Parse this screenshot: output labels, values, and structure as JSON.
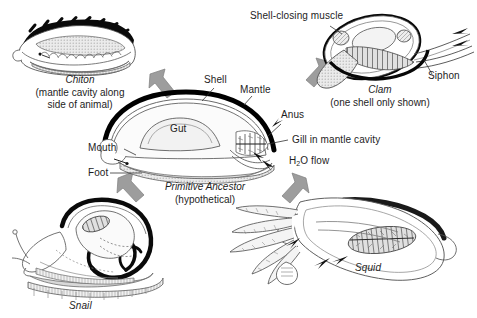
{
  "figure": {
    "background_color": "#ffffff",
    "ink_color": "#1d1d1d",
    "shell_color": "#000000",
    "arrow_color": "#9a9a9a",
    "tissue_fill": "#e3e3e3"
  },
  "center": {
    "name_italic": "Primitive Ancestor",
    "name_sub": "(hypothetical)",
    "labels": {
      "shell": "Shell",
      "mantle": "Mantle",
      "anus": "Anus",
      "gut": "Gut",
      "mouth": "Mouth",
      "foot": "Foot",
      "gill": "Gill in mantle cavity",
      "water_flow_pre": "H",
      "water_flow_sub": "2",
      "water_flow_post": "O flow"
    }
  },
  "chiton": {
    "name_italic": "Chiton",
    "caption_line1": "(mantle cavity along",
    "caption_line2": "side of animal)"
  },
  "clam": {
    "name_italic": "Clam",
    "caption": "(one shell only shown)",
    "labels": {
      "muscle": "Shell-closing muscle",
      "siphon": "Siphon"
    }
  },
  "snail": {
    "name_italic": "Snail"
  },
  "squid": {
    "name_italic": "Squid"
  },
  "arrows": [
    {
      "id": "arrow-to-chiton",
      "direction": "up-left",
      "target": "chiton"
    },
    {
      "id": "arrow-to-clam",
      "direction": "up-right",
      "target": "clam"
    },
    {
      "id": "arrow-to-snail",
      "direction": "down-left",
      "target": "snail"
    },
    {
      "id": "arrow-to-squid",
      "direction": "down-right",
      "target": "squid"
    }
  ]
}
